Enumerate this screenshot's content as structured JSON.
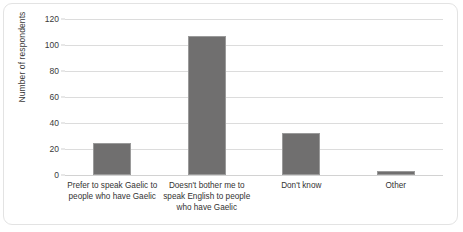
{
  "chart_data": {
    "type": "bar",
    "title": "",
    "subtitle": "",
    "xlabel": "",
    "ylabel": "Number of respondents",
    "categories": [
      "Prefer to speak Gaelic to people who have Gaelic",
      "Doesn't bother me to speak English to people who have Gaelic",
      "Don't know",
      "Other"
    ],
    "values": [
      25,
      107,
      32,
      3
    ],
    "ylim": [
      0,
      120
    ],
    "ytick_values": [
      0,
      20,
      40,
      60,
      80,
      100,
      120
    ],
    "ytick_labels": [
      "0",
      "20",
      "40",
      "60",
      "80",
      "100",
      "120"
    ],
    "grid": true,
    "legend": false,
    "legend_position": "none",
    "bar_color": "#706f6f",
    "bar_edge_color": "#9a9a9a",
    "gridline_color": "#dcdcdc",
    "background_color": "#ffffff",
    "border_color": "#e3e3e3"
  }
}
